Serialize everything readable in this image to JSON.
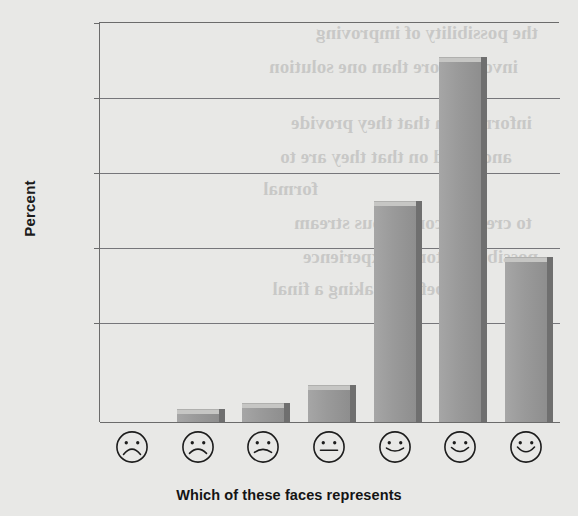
{
  "chart_data": {
    "type": "bar",
    "title": "",
    "xlabel": "Which of these faces represents",
    "ylabel": "Percent",
    "categories": [
      "very-sad-face",
      "sad-face",
      "slightly-sad-face",
      "neutral-face",
      "slightly-happy-face",
      "happy-face",
      "very-happy-face"
    ],
    "values": [
      0,
      1,
      1.8,
      4,
      27,
      45,
      20
    ],
    "ylim": [
      0,
      50
    ],
    "yticks": [
      10,
      20,
      30,
      40,
      50
    ],
    "ytick_labels": [
      "10",
      "20",
      "30",
      "40",
      "50"
    ],
    "grid": true,
    "legend": false,
    "bar_color": "#9a9a9a",
    "bar_top_color": "#c6c6c4",
    "bar_side_color": "#6f6f6f",
    "axis_color": "#6b6b6b",
    "grid_color": "#76767a",
    "background": "#e8e8e6",
    "text_color": "#1b1b1b"
  },
  "axis": {
    "y_title": "Percent",
    "x_title": "Which of these faces represents",
    "tick_10": "10",
    "tick_20": "20",
    "tick_30": "30",
    "tick_40": "40",
    "tick_50": "50"
  },
  "faces": [
    {
      "name": "very-sad-face",
      "mouth": "deep-frown"
    },
    {
      "name": "sad-face",
      "mouth": "frown"
    },
    {
      "name": "slightly-sad-face",
      "mouth": "slight-frown"
    },
    {
      "name": "neutral-face",
      "mouth": "flat"
    },
    {
      "name": "slightly-happy-face",
      "mouth": "slight-smile"
    },
    {
      "name": "happy-face",
      "mouth": "smile"
    },
    {
      "name": "very-happy-face",
      "mouth": "big-smile"
    }
  ],
  "bleed_text": {
    "l1": "the possibility of improving",
    "l2": "involve more than one solution",
    "l3": "information that they provide",
    "l4": "and acted on that they are to",
    "l5": "formal",
    "l6": "to create a continuous stream",
    "l7": "possible customer experience",
    "l8": "a before making a final"
  }
}
